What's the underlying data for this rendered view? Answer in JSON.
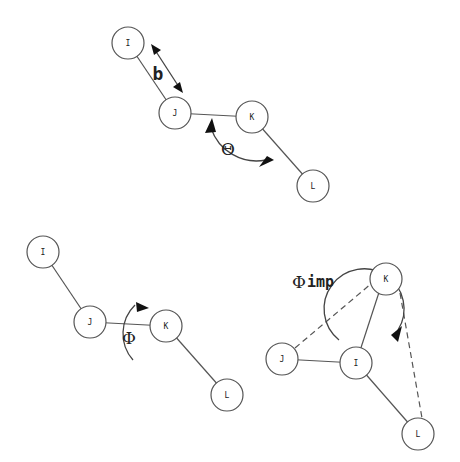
{
  "diagrams": {
    "bond_angle": {
      "atoms": {
        "I": "I",
        "J": "J",
        "K": "K",
        "L": "L"
      },
      "bond_length_label": "b",
      "angle_label": "Θ"
    },
    "dihedral": {
      "atoms": {
        "I": "I",
        "J": "J",
        "K": "K",
        "L": "L"
      },
      "angle_label": "Φ"
    },
    "improper": {
      "atoms": {
        "I": "I",
        "J": "J",
        "K": "K",
        "L": "L"
      },
      "angle_label": "Φ",
      "angle_subscript": "imp"
    }
  },
  "colors": {
    "stroke": "#555555",
    "arrowhead": "#111111",
    "background": "#ffffff"
  }
}
